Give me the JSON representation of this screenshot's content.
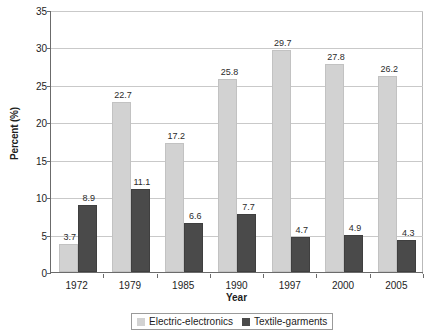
{
  "chart_data": {
    "type": "bar",
    "title": "",
    "xlabel": "Year",
    "ylabel": "Percent (%)",
    "categories": [
      "1972",
      "1979",
      "1985",
      "1990",
      "1997",
      "2000",
      "2005"
    ],
    "series": [
      {
        "name": "Electric-electronics",
        "color": "#d2d2d2",
        "values": [
          3.7,
          22.7,
          17.2,
          25.8,
          29.7,
          27.8,
          26.2
        ]
      },
      {
        "name": "Textile-garments",
        "color": "#4a4a4a",
        "values": [
          8.9,
          11.1,
          6.6,
          7.7,
          4.7,
          4.9,
          4.3
        ]
      }
    ],
    "ylim": [
      0,
      35
    ],
    "yticks": [
      0,
      5,
      10,
      15,
      20,
      25,
      30,
      35
    ],
    "ytick_labels": [
      "0",
      "5",
      "10",
      "15",
      "20",
      "25",
      "30",
      "35"
    ],
    "grid": true,
    "legend_position": "bottom"
  },
  "legend": {
    "items": [
      {
        "label": "Electric-electronics",
        "color": "#d2d2d2"
      },
      {
        "label": "Textile-garments",
        "color": "#4a4a4a"
      }
    ]
  },
  "axes": {
    "y_title": "Percent (%)",
    "x_title": "Year"
  }
}
